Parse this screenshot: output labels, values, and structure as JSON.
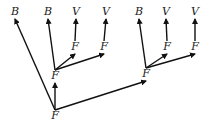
{
  "diagram": {
    "nodes": [
      {
        "id": "b1",
        "label": "B"
      },
      {
        "id": "b2",
        "label": "B"
      },
      {
        "id": "v1",
        "label": "V"
      },
      {
        "id": "v2",
        "label": "V"
      },
      {
        "id": "b3",
        "label": "B"
      },
      {
        "id": "v3",
        "label": "V"
      },
      {
        "id": "v4",
        "label": "V"
      },
      {
        "id": "f1",
        "label": "F"
      },
      {
        "id": "f2",
        "label": "F"
      },
      {
        "id": "f3",
        "label": "F"
      },
      {
        "id": "f4",
        "label": "F"
      },
      {
        "id": "fl",
        "label": "F"
      },
      {
        "id": "fr",
        "label": "F"
      },
      {
        "id": "froot",
        "label": "F"
      }
    ],
    "edges": [
      {
        "from": "froot",
        "to": "fl"
      },
      {
        "from": "froot",
        "to": "fr"
      },
      {
        "from": "froot",
        "to": "b1"
      },
      {
        "from": "fl",
        "to": "b2"
      },
      {
        "from": "fl",
        "to": "f1"
      },
      {
        "from": "fl",
        "to": "f2"
      },
      {
        "from": "f1",
        "to": "v1"
      },
      {
        "from": "f2",
        "to": "v2"
      },
      {
        "from": "fr",
        "to": "b3"
      },
      {
        "from": "fr",
        "to": "f3"
      },
      {
        "from": "fr",
        "to": "f4"
      },
      {
        "from": "f3",
        "to": "v3"
      },
      {
        "from": "f4",
        "to": "v4"
      }
    ]
  }
}
